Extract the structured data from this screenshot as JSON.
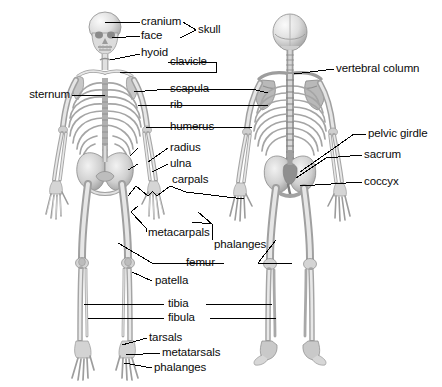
{
  "diagram": {
    "background_color": "#ffffff",
    "line_color": "#000000",
    "text_color": "#0a0a0a",
    "bone_fill": "#e8e8e8",
    "bone_shade": "#9a9a9a",
    "views": [
      {
        "name": "anterior-skeleton",
        "orientation": "front"
      },
      {
        "name": "posterior-skeleton",
        "orientation": "back"
      }
    ]
  },
  "labels": {
    "cranium": "cranium",
    "face": "face",
    "skull": "skull",
    "hyoid": "hyoid",
    "clavicle": "clavicle",
    "sternum": "sternum",
    "scapula": "scapula",
    "rib": "rib",
    "humerus": "humerus",
    "radius": "radius",
    "ulna": "ulna",
    "carpals": "carpals",
    "metacarpals": "metacarpals",
    "phalanges_hand": "phalanges",
    "vertebral_column": "vertebral column",
    "pelvic_girdle": "pelvic girdle",
    "sacrum": "sacrum",
    "coccyx": "coccyx",
    "femur": "femur",
    "patella": "patella",
    "tibia": "tibia",
    "fibula": "fibula",
    "tarsals": "tarsals",
    "metatarsals": "metatarsals",
    "phalanges_foot": "phalanges"
  }
}
